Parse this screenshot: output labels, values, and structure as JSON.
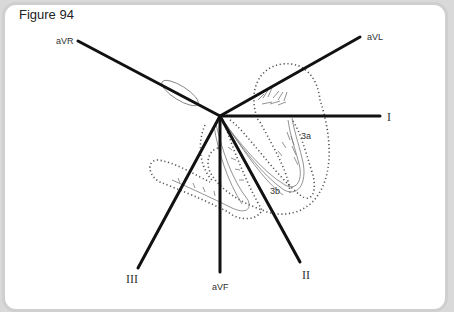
{
  "figure": {
    "title": "Figure 94",
    "origin": {
      "x": 220,
      "y": 116
    },
    "leads": [
      {
        "name": "aVR",
        "x": 78,
        "y": 41,
        "label_x": 56,
        "label_y": 41
      },
      {
        "name": "aVL",
        "x": 360,
        "y": 37,
        "label_x": 366,
        "label_y": 39
      },
      {
        "name": "I",
        "x": 380,
        "y": 116,
        "label_x": 387,
        "label_y": 120
      },
      {
        "name": "III",
        "x": 138,
        "y": 268,
        "label_x": 128,
        "label_y": 281
      },
      {
        "name": "aVF",
        "x": 220,
        "y": 272,
        "label_x": 212,
        "label_y": 289
      },
      {
        "name": "II",
        "x": 300,
        "y": 262,
        "label_x": 302,
        "label_y": 277
      }
    ],
    "region_labels": [
      {
        "text": "3a",
        "x": 301,
        "y": 139
      },
      {
        "text": "3b",
        "x": 270,
        "y": 194
      }
    ],
    "colors": {
      "lead_line": "#111111",
      "sketch": "#777777",
      "dotted_outline": "#555555",
      "frame_border": "#cfcfcf",
      "background": "#ffffff"
    }
  }
}
